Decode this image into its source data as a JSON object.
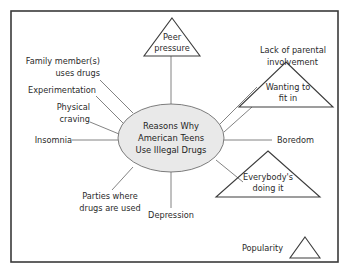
{
  "diagram": {
    "title": "Reasons Why American Teens Use Illegal Drugs",
    "center": {
      "line1": "Reasons Why",
      "line2": "American Teens",
      "line3": "Use Illegal Drugs"
    },
    "colors": {
      "frame": "#3a3a3a",
      "ellipse_fill": "#e9e9e9",
      "ellipse_stroke": "#6e6e6e",
      "spoke": "#5a5a5a",
      "triangle_stroke": "#3c3c3c",
      "text": "#2b2b2b",
      "background": "#ffffff"
    },
    "plain_labels": [
      {
        "id": "family-member-uses-drugs",
        "lines": [
          "Family member(s)",
          "uses drugs"
        ]
      },
      {
        "id": "experimentation",
        "lines": [
          "Experimentation"
        ]
      },
      {
        "id": "physical-craving",
        "lines": [
          "Physical",
          "craving"
        ]
      },
      {
        "id": "insomnia",
        "lines": [
          "Insomnia"
        ]
      },
      {
        "id": "parties-where-drugs-are-used",
        "lines": [
          "Parties where",
          "drugs are used"
        ]
      },
      {
        "id": "depression",
        "lines": [
          "Depression"
        ]
      },
      {
        "id": "boredom",
        "lines": [
          "Boredom"
        ]
      },
      {
        "id": "lack-of-parental-involvement",
        "lines": [
          "Lack of parental",
          "involvement"
        ]
      }
    ],
    "triangle_labels": [
      {
        "id": "peer-pressure",
        "lines": [
          "Peer",
          "pressure"
        ]
      },
      {
        "id": "wanting-to-fit-in",
        "lines": [
          "Wanting to",
          "fit in"
        ]
      },
      {
        "id": "everybodys-doing-it",
        "lines": [
          "Everybody's",
          "doing it"
        ]
      }
    ],
    "legend": {
      "label": "Popularity",
      "shape": "triangle-icon"
    }
  }
}
